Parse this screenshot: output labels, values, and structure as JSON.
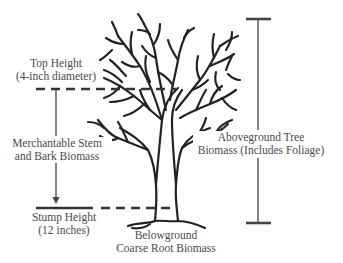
{
  "figure": {
    "type": "tree biomass component diagram",
    "colors": {
      "ink": "#222222",
      "label_text": "#4a4a4a",
      "guide_lines": "#444444",
      "background": "#ffffff"
    }
  },
  "labels": {
    "top_height": {
      "line1": "Top Height",
      "line2": "(4-inch diameter)"
    },
    "merchantable": {
      "line1": "Merchantable Stem",
      "line2": "and Bark Biomass"
    },
    "stump_height": {
      "line1": "Stump Height",
      "line2": "(12 inches)"
    },
    "belowground": {
      "line1": "Belowground",
      "line2": "Coarse Root Biomass"
    },
    "aboveground": {
      "line1": "Aboveground Tree",
      "line2": "Biomass (Includes Foliage)"
    }
  },
  "markers": {
    "top_height_line": "dashed-horizontal",
    "stump_height_line": "solid-then-dashed-horizontal",
    "merchantable_arrow": "vertical-arrow-down",
    "aboveground_bracket": "vertical-i-beam"
  }
}
